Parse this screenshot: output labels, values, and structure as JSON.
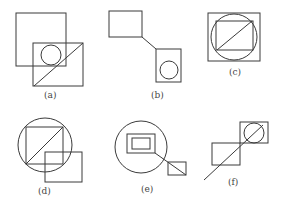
{
  "figures": [
    {
      "id": "a",
      "label": "(a)"
    },
    {
      "id": "b",
      "label": "(b)"
    },
    {
      "id": "c",
      "label": "(c)"
    },
    {
      "id": "d",
      "label": "(d)"
    },
    {
      "id": "e",
      "label": "(e)"
    },
    {
      "id": "f",
      "label": "(f)"
    }
  ],
  "colors": {
    "stroke": "#3a3a3a",
    "background": "#ffffff"
  }
}
